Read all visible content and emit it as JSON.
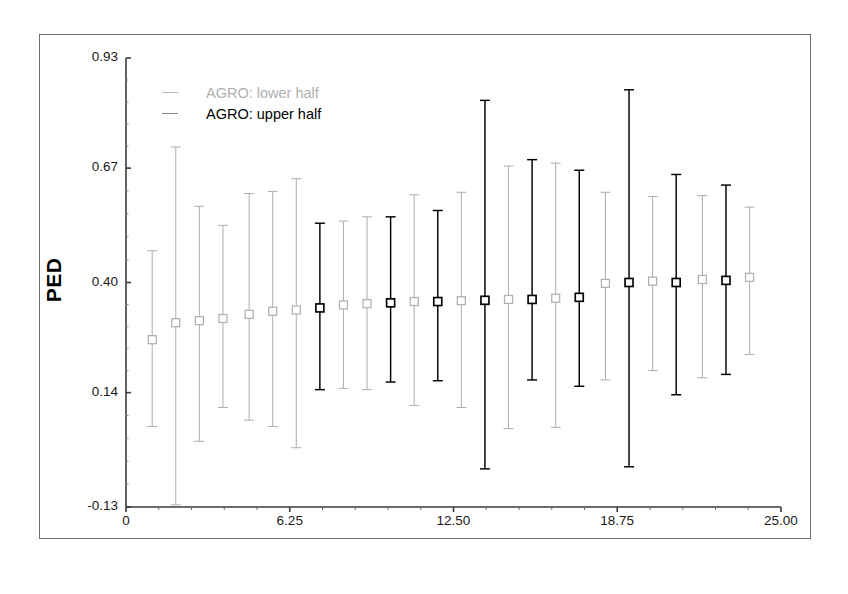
{
  "figure": {
    "ylabel": "PED",
    "legend": [
      {
        "label": "AGRO: lower half",
        "color": "#b0b0b0",
        "series_key": "lower"
      },
      {
        "label": "AGRO: upper half",
        "color": "#000000",
        "series_key": "upper"
      }
    ]
  },
  "chart_data": {
    "type": "scatter",
    "title": "",
    "xlabel": "",
    "ylabel": "PED",
    "xlim": [
      0,
      25.0
    ],
    "ylim": [
      -0.13,
      0.93
    ],
    "grid": false,
    "legend_position": "top-left-inside",
    "xticks": [
      "0",
      "6.25",
      "12.50",
      "18.75",
      "25.00"
    ],
    "xtick_values": [
      0,
      6.25,
      12.5,
      18.75,
      25.0
    ],
    "yticks": [
      "0.93",
      "0.67",
      "0.40",
      "0.14",
      "-0.13"
    ],
    "ytick_values": [
      0.93,
      0.67,
      0.4,
      0.14,
      -0.13
    ],
    "marker": "open-square",
    "error_bar_style": "capped-vertical",
    "series": [
      {
        "name": "AGRO: lower half",
        "key": "lower",
        "color": "#b0b0b0",
        "points": [
          {
            "x": 1.0,
            "y": 0.265,
            "low": 0.06,
            "high": 0.475
          },
          {
            "x": 1.9,
            "y": 0.305,
            "low": -0.125,
            "high": 0.72
          },
          {
            "x": 2.8,
            "y": 0.31,
            "low": 0.025,
            "high": 0.58
          },
          {
            "x": 3.7,
            "y": 0.315,
            "low": 0.105,
            "high": 0.535
          },
          {
            "x": 4.7,
            "y": 0.325,
            "low": 0.075,
            "high": 0.61
          },
          {
            "x": 5.6,
            "y": 0.332,
            "low": 0.06,
            "high": 0.615
          },
          {
            "x": 6.5,
            "y": 0.335,
            "low": 0.01,
            "high": 0.645
          },
          {
            "x": 8.3,
            "y": 0.347,
            "low": 0.15,
            "high": 0.545
          },
          {
            "x": 9.2,
            "y": 0.35,
            "low": 0.147,
            "high": 0.555
          },
          {
            "x": 11.0,
            "y": 0.355,
            "low": 0.11,
            "high": 0.607
          },
          {
            "x": 12.8,
            "y": 0.357,
            "low": 0.105,
            "high": 0.613
          },
          {
            "x": 14.6,
            "y": 0.36,
            "low": 0.055,
            "high": 0.675
          },
          {
            "x": 16.4,
            "y": 0.363,
            "low": 0.058,
            "high": 0.682
          },
          {
            "x": 18.3,
            "y": 0.398,
            "low": 0.17,
            "high": 0.613
          },
          {
            "x": 20.1,
            "y": 0.403,
            "low": 0.192,
            "high": 0.603
          },
          {
            "x": 22.0,
            "y": 0.407,
            "low": 0.175,
            "high": 0.605
          },
          {
            "x": 23.8,
            "y": 0.412,
            "low": 0.23,
            "high": 0.578
          }
        ]
      },
      {
        "name": "AGRO: upper half",
        "key": "upper",
        "color": "#000000",
        "points": [
          {
            "x": 7.4,
            "y": 0.34,
            "low": 0.147,
            "high": 0.54
          },
          {
            "x": 10.1,
            "y": 0.352,
            "low": 0.165,
            "high": 0.555
          },
          {
            "x": 11.9,
            "y": 0.355,
            "low": 0.168,
            "high": 0.57
          },
          {
            "x": 13.7,
            "y": 0.358,
            "low": -0.04,
            "high": 0.83
          },
          {
            "x": 15.5,
            "y": 0.36,
            "low": 0.17,
            "high": 0.69
          },
          {
            "x": 17.3,
            "y": 0.365,
            "low": 0.155,
            "high": 0.665
          },
          {
            "x": 19.2,
            "y": 0.4,
            "low": -0.035,
            "high": 0.855
          },
          {
            "x": 21.0,
            "y": 0.4,
            "low": 0.135,
            "high": 0.655
          },
          {
            "x": 22.9,
            "y": 0.405,
            "low": 0.183,
            "high": 0.63
          }
        ]
      }
    ]
  }
}
